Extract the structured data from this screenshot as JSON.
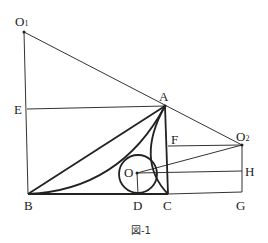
{
  "labels": {
    "O1": "O",
    "O1_sub": "1",
    "O2": "O",
    "O2_sub": "2",
    "A": "A",
    "B": "B",
    "C": "C",
    "D": "D",
    "E": "E",
    "F": "F",
    "G": "G",
    "H": "H",
    "O": "O"
  },
  "caption": "図-1"
}
